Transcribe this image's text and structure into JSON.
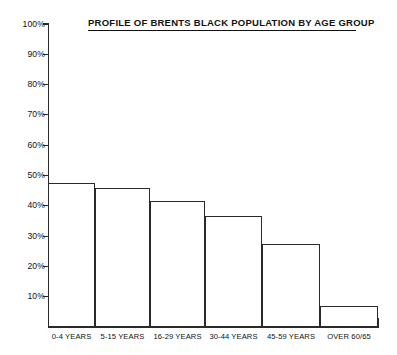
{
  "chart_data": {
    "type": "bar",
    "title": "PROFILE OF BRENTS BLACK POPULATION BY AGE GROUP",
    "xlabel": "",
    "ylabel": "",
    "categories": [
      "0-4 YEARS",
      "5-15 YEARS",
      "16-29 YEARS",
      "30-44 YEARS",
      "45-59 YEARS",
      "OVER 60/65"
    ],
    "values": [
      47.5,
      46,
      41.5,
      36.5,
      27.5,
      7
    ],
    "ylim": [
      0,
      100
    ],
    "ytick_labels": [
      "100%",
      "90%",
      "80%",
      "70%",
      "60%",
      "50%",
      "40%",
      "30%",
      "20%",
      "10%"
    ],
    "ytick_values": [
      100,
      90,
      80,
      70,
      60,
      50,
      40,
      30,
      20,
      10
    ],
    "grid": false,
    "legend": false,
    "series": [
      {
        "name": "Share of population",
        "values": [
          47.5,
          46,
          41.5,
          36.5,
          27.5,
          7
        ]
      }
    ],
    "colors": {
      "bar_outline": "#2a2a2a",
      "bar_fill": "#ffffff",
      "axis": "#2a2a2a",
      "text": "#111111",
      "background": "#ffffff"
    }
  }
}
